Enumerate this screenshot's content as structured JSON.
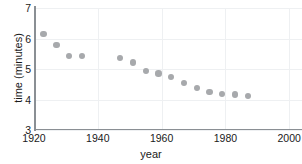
{
  "chart_data": {
    "type": "scatter",
    "title": "",
    "xlabel": "year",
    "ylabel": "time (minutes)",
    "xlim": [
      1920,
      2004
    ],
    "ylim": [
      3,
      7
    ],
    "xticks": [
      1920,
      1940,
      1960,
      1980,
      2000
    ],
    "xtick_labels": [
      "1920",
      "1940",
      "1960",
      "1980",
      "2000"
    ],
    "yticks": [
      3,
      4,
      5,
      6,
      7
    ],
    "ytick_labels": [
      "3",
      "4",
      "5",
      "6",
      "7"
    ],
    "grid": true,
    "legend": "none",
    "marker_color": "#a7a9ac",
    "axis_color": "#8a8f94",
    "grid_color": "#eef0f2",
    "x": [
      1923,
      1927,
      1931,
      1935,
      1947,
      1951,
      1955,
      1959,
      1963,
      1967,
      1971,
      1975,
      1979,
      1983,
      1987
    ],
    "y": [
      6.15,
      5.78,
      5.42,
      5.42,
      5.36,
      5.22,
      4.94,
      4.85,
      4.73,
      4.55,
      4.37,
      4.25,
      4.19,
      4.16,
      4.11
    ],
    "points": [
      {
        "x": 1923,
        "y": 6.15
      },
      {
        "x": 1927,
        "y": 5.78
      },
      {
        "x": 1931,
        "y": 5.42
      },
      {
        "x": 1935,
        "y": 5.42
      },
      {
        "x": 1947,
        "y": 5.36
      },
      {
        "x": 1951,
        "y": 5.22
      },
      {
        "x": 1955,
        "y": 4.94
      },
      {
        "x": 1959,
        "y": 4.85
      },
      {
        "x": 1963,
        "y": 4.73
      },
      {
        "x": 1967,
        "y": 4.55
      },
      {
        "x": 1971,
        "y": 4.37
      },
      {
        "x": 1975,
        "y": 4.25
      },
      {
        "x": 1979,
        "y": 4.19
      },
      {
        "x": 1983,
        "y": 4.16
      },
      {
        "x": 1987,
        "y": 4.11
      }
    ]
  }
}
